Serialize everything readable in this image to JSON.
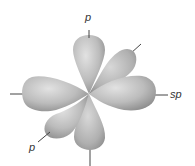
{
  "diagram": {
    "labels": {
      "top_p": "p",
      "right_sp": "sp",
      "bottom_left_p": "p"
    },
    "colors": {
      "background": "#ffffff",
      "lobe_light": "#dcdcdc",
      "lobe_mid": "#b4b4b4",
      "lobe_dark": "#8e8e8e",
      "axis_line": "#444444",
      "label_text": "#333333"
    }
  }
}
